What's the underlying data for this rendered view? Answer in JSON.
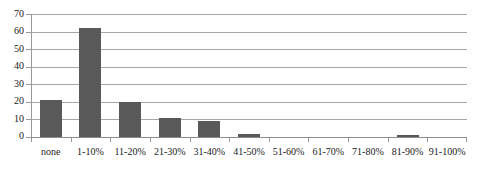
{
  "chart_data": {
    "type": "bar",
    "title": "",
    "xlabel": "",
    "ylabel": "",
    "categories": [
      "none",
      "1-10%",
      "11-20%",
      "21-30%",
      "31-40%",
      "41-50%",
      "51-60%",
      "61-70%",
      "71-80%",
      "81-90%",
      "91-100%"
    ],
    "values": [
      21,
      62,
      20,
      11,
      9,
      2,
      0,
      0,
      0,
      1,
      0
    ],
    "ylim": [
      0,
      70
    ],
    "yticks": [
      0,
      10,
      20,
      30,
      40,
      50,
      60,
      70
    ],
    "ytick_labels": [
      "0",
      "10",
      "20",
      "30",
      "40",
      "50",
      "60",
      "70"
    ],
    "grid": true,
    "legend": false,
    "bar_color": "#595959",
    "gridline_color": "#a6a6a6",
    "axis_color": "#9a9a9a",
    "background_color": "#ffffff",
    "text_color": "#1a1a1a"
  }
}
